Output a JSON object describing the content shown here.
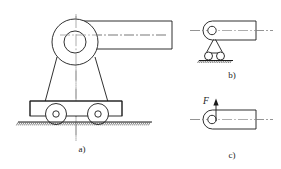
{
  "figure": {
    "title_absent": true,
    "background_color": "#ffffff",
    "line_color": "#1a1a1a",
    "centerline_color": "#8a8a8a",
    "subfigures": [
      {
        "id": "a",
        "caption": "a)",
        "caption_x": 82,
        "caption_y": 150,
        "description": "cannon on wheeled carriage, front-quarter schematic",
        "parts": {
          "hub_outer_circle": {
            "cx": 75,
            "cy": 42,
            "r": 23
          },
          "hub_inner_circle": {
            "cx": 75,
            "cy": 42,
            "r": 11
          },
          "barrel": {
            "x1": 75,
            "y1": 21,
            "x2": 172,
            "y2": 49
          },
          "trunnion_left_leg": {
            "x1": 56,
            "y1": 57,
            "x2": 45,
            "y2": 101
          },
          "trunnion_right_leg": {
            "x1": 96,
            "y1": 56,
            "x2": 108,
            "y2": 101
          },
          "carriage_base": {
            "x": 30,
            "y": 101,
            "w": 92,
            "h": 15
          },
          "wheel_left": {
            "cx": 56,
            "cy": 114,
            "r": 10.5,
            "hub_r": 3.2
          },
          "wheel_right": {
            "cx": 98,
            "cy": 114,
            "r": 10.5,
            "hub_r": 3.2
          },
          "ground": {
            "x1": 18,
            "x2": 152,
            "y": 122
          },
          "vertical_centerline": {
            "x": 76,
            "y1": 14,
            "y2": 140
          }
        }
      },
      {
        "id": "b",
        "caption": "b)",
        "caption_x": 232,
        "caption_y": 76,
        "description": "simplified side view: rounded-end link supported by two rollers on ground",
        "parts": {
          "body": {
            "x": 203,
            "y": 21,
            "w": 53,
            "h": 19,
            "left_round_r": 9.5
          },
          "pin_circle": {
            "cx": 212,
            "cy": 30.5,
            "r": 4.2
          },
          "horizontal_centerline": {
            "x1": 190,
            "x2": 272,
            "y": 30.5
          },
          "bracket_apex": {
            "x": 215,
            "y": 41
          },
          "roller_left": {
            "cx": 208.5,
            "cy": 56,
            "r": 4.2
          },
          "roller_right": {
            "cx": 220.5,
            "cy": 56,
            "r": 4.2
          },
          "ground": {
            "x1": 199,
            "x2": 233,
            "y": 60
          }
        }
      },
      {
        "id": "c",
        "caption": "c)",
        "caption_x": 232,
        "caption_y": 156,
        "description": "free-body: same link with upward reaction force F at the pin",
        "force_label": "F",
        "parts": {
          "body": {
            "x": 203,
            "y": 110,
            "w": 53,
            "h": 19,
            "left_round_r": 9.5
          },
          "pin_circle": {
            "cx": 212,
            "cy": 119.5,
            "r": 4.2
          },
          "horizontal_centerline": {
            "x1": 190,
            "x2": 272,
            "y": 119.5
          },
          "force_arrow": {
            "x": 216,
            "y_tail": 119.5,
            "y_head": 100
          },
          "force_label_pos": {
            "x": 205,
            "y": 104
          }
        }
      }
    ]
  }
}
